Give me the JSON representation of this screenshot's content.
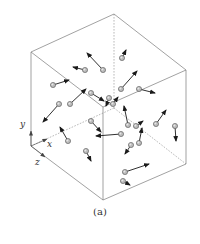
{
  "figure": {
    "caption": "(a)",
    "axes": {
      "x_label": "x",
      "y_label": "y",
      "z_label": "z"
    },
    "colors": {
      "edge": "#7a7a7a",
      "arrow": "#1a1a1a",
      "ball": "#b9b9b9"
    }
  },
  "cube": {
    "visible_edges": [
      [
        114,
        14,
        31,
        52
      ],
      [
        114,
        14,
        186,
        70
      ],
      [
        31,
        52,
        103,
        107
      ],
      [
        186,
        70,
        103,
        107
      ],
      [
        31,
        52,
        31,
        146
      ],
      [
        103,
        107,
        103,
        200
      ],
      [
        186,
        70,
        186,
        164
      ],
      [
        31,
        146,
        103,
        200
      ],
      [
        103,
        200,
        186,
        164
      ]
    ],
    "hidden_edges": [
      [
        114,
        14,
        114,
        108
      ],
      [
        114,
        108,
        31,
        146
      ],
      [
        114,
        108,
        186,
        164
      ]
    ]
  },
  "particles": [
    {
      "x": 103,
      "y": 70,
      "tx": 87,
      "ty": 53
    },
    {
      "x": 85,
      "y": 70,
      "tx": 73,
      "ty": 67
    },
    {
      "x": 53,
      "y": 85,
      "tx": 69,
      "ty": 80
    },
    {
      "x": 122,
      "y": 58,
      "tx": 126,
      "ty": 50
    },
    {
      "x": 121,
      "y": 89,
      "tx": 137,
      "ty": 71
    },
    {
      "x": 139,
      "y": 89,
      "tx": 155,
      "ty": 93
    },
    {
      "x": 91,
      "y": 93,
      "tx": 104,
      "ty": 101
    },
    {
      "x": 109,
      "y": 98,
      "tx": 106,
      "ty": 106
    },
    {
      "x": 70,
      "y": 104,
      "tx": 86,
      "ty": 89
    },
    {
      "x": 59,
      "y": 104,
      "tx": 43,
      "ty": 122
    },
    {
      "x": 68,
      "y": 141,
      "tx": 60,
      "ty": 127
    },
    {
      "x": 86,
      "y": 151,
      "tx": 91,
      "ty": 161
    },
    {
      "x": 121,
      "y": 134,
      "tx": 96,
      "ty": 136
    },
    {
      "x": 131,
      "y": 145,
      "tx": 125,
      "ty": 154
    },
    {
      "x": 139,
      "y": 143,
      "tx": 142,
      "ty": 128
    },
    {
      "x": 128,
      "y": 125,
      "tx": 124,
      "ty": 106
    },
    {
      "x": 136,
      "y": 126,
      "tx": 143,
      "ty": 121
    },
    {
      "x": 156,
      "y": 124,
      "tx": 166,
      "ty": 110
    },
    {
      "x": 175,
      "y": 126,
      "tx": 176,
      "ty": 141
    },
    {
      "x": 125,
      "y": 172,
      "tx": 149,
      "ty": 164
    },
    {
      "x": 123,
      "y": 181,
      "tx": 130,
      "ty": 185
    },
    {
      "x": 113,
      "y": 104,
      "tx": 118,
      "ty": 97
    },
    {
      "x": 91,
      "y": 121,
      "tx": 101,
      "ty": 132
    }
  ]
}
